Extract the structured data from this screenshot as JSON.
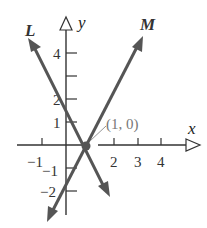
{
  "figure": {
    "axes": {
      "x_label": "x",
      "y_label": "y",
      "x_tick_labels": [
        "−1",
        "2",
        "3",
        "4"
      ],
      "y_tick_labels": [
        "4",
        "2",
        "1",
        "−1",
        "−2"
      ]
    },
    "lines": [
      {
        "name": "L",
        "equation": "y = -2x + 2",
        "color": "#555555"
      },
      {
        "name": "M",
        "equation": "y = 2x - 2",
        "color": "#555555"
      }
    ],
    "point": {
      "label": "(1, 0)",
      "x": 1,
      "y": 0,
      "color": "#555555"
    },
    "colors": {
      "axis": "#333333",
      "lines": "#555555",
      "label_gray": "#777777"
    }
  }
}
